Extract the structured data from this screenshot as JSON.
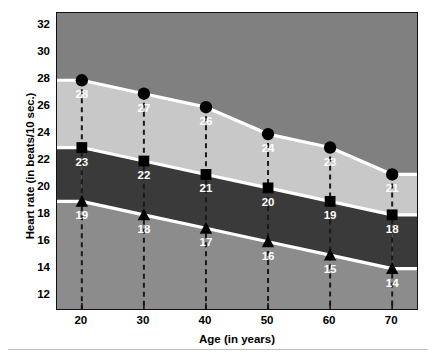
{
  "chart_data": {
    "type": "area",
    "title": "",
    "subtitle": "",
    "xlabel": "Age (in years)",
    "ylabel": "Heart rate (in beats/10 sec.)",
    "x": [
      20,
      30,
      40,
      50,
      60,
      70
    ],
    "categories": [
      "20",
      "30",
      "40",
      "50",
      "60",
      "70"
    ],
    "xlim": [
      16,
      74
    ],
    "ylim": [
      11,
      33
    ],
    "xticks": [
      "20",
      "30",
      "40",
      "50",
      "60",
      "70"
    ],
    "yticks": [
      "12",
      "14",
      "16",
      "18",
      "20",
      "22",
      "24",
      "26",
      "28",
      "30",
      "32"
    ],
    "grid": false,
    "legend": "none",
    "series": [
      {
        "name": "upper-boundary",
        "marker": "circle",
        "values": [
          28,
          27,
          26,
          24,
          23,
          21
        ],
        "labels": [
          "28",
          "27",
          "26",
          "24",
          "23",
          "21"
        ]
      },
      {
        "name": "middle-boundary",
        "marker": "square",
        "values": [
          23,
          22,
          21,
          20,
          19,
          18
        ],
        "labels": [
          "23",
          "22",
          "21",
          "20",
          "19",
          "18"
        ]
      },
      {
        "name": "lower-boundary",
        "marker": "triangle",
        "values": [
          19,
          18,
          17,
          16,
          15,
          14
        ],
        "labels": [
          "19",
          "18",
          "17",
          "16",
          "15",
          "14"
        ]
      }
    ],
    "bands": [
      {
        "name": "zone-above-upper",
        "color": "#808080"
      },
      {
        "name": "zone-upper-to-middle",
        "color": "#c8c8c8"
      },
      {
        "name": "zone-middle-to-lower",
        "color": "#3a3a3a"
      },
      {
        "name": "zone-below-lower",
        "color": "#8c8c8c"
      }
    ],
    "colors": {
      "boundary_line": "#ffffff",
      "marker": "#000000",
      "data_label": "#ffffff",
      "axis": "#000000",
      "drop_line": "#1a1a1a"
    }
  }
}
